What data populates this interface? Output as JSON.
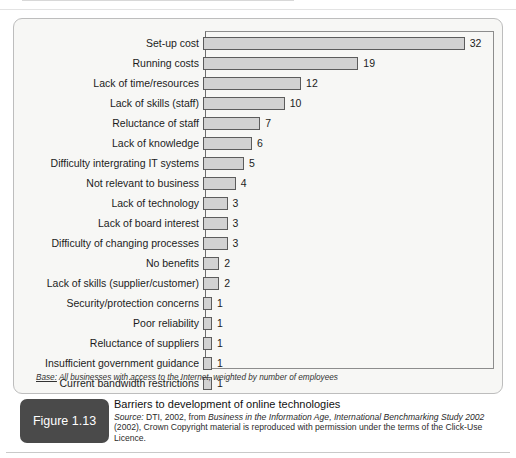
{
  "figure": {
    "badge_label": "Figure 1.13",
    "title": "Barriers to development of online technologies",
    "source_prefix": "Source:",
    "source_text_1": " DTI, 2002, from ",
    "source_italic_work": "Business in the Information Age, International Benchmarking Study 2002",
    "source_text_2": " (2002), Crown Copyright material is reproduced with permission under the terms of the Click-Use Licence.",
    "base_note_label": "Base:",
    "base_note_text": " All businesses with access to the Internet, weighted by number of employees"
  },
  "colors": {
    "bar_fill": "#d2d2d2",
    "bar_border": "#5c5c5c",
    "panel_bg": "#f7f7f5",
    "badge_bg": "#4a4a4a"
  },
  "chart_data": {
    "type": "bar",
    "orientation": "horizontal",
    "title": "Barriers to development of online technologies",
    "xlabel": "",
    "ylabel": "",
    "xlim": [
      0,
      34
    ],
    "grid": false,
    "legend": null,
    "categories": [
      "Set-up cost",
      "Running costs",
      "Lack of time/resources",
      "Lack of skills (staff)",
      "Reluctance of staff",
      "Lack of knowledge",
      "Difficulty intergrating IT systems",
      "Not relevant to business",
      "Lack of technology",
      "Lack of board interest",
      "Difficulty of changing processes",
      "No benefits",
      "Lack of skills (supplier/customer)",
      "Security/protection concerns",
      "Poor reliability",
      "Reluctance of suppliers",
      "Insufficient government guidance",
      "Current bandwidth restrictions"
    ],
    "values": [
      32,
      19,
      12,
      10,
      7,
      6,
      5,
      4,
      3,
      3,
      3,
      2,
      2,
      1,
      1,
      1,
      1,
      1
    ]
  }
}
